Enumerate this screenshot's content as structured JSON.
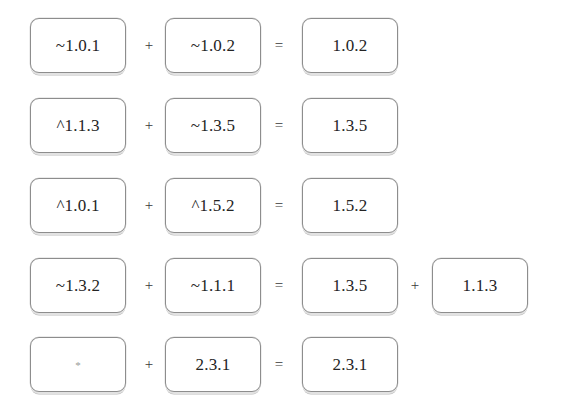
{
  "diagram": {
    "type": "semver-range-resolution",
    "title": "",
    "background_color": "#ffffff",
    "node_border_color": "#8d8d8d",
    "text_color": "#242424",
    "rows": [
      {
        "id": "row-1",
        "terms": [
          {
            "label": "~1.0.1",
            "kind": "range"
          },
          {
            "op": "+"
          },
          {
            "label": "~1.0.2",
            "kind": "range"
          },
          {
            "op": "="
          },
          {
            "label": "1.0.2",
            "kind": "resolved"
          }
        ]
      },
      {
        "id": "row-2",
        "terms": [
          {
            "label": "^1.1.3",
            "kind": "range"
          },
          {
            "op": "+"
          },
          {
            "label": "~1.3.5",
            "kind": "range"
          },
          {
            "op": "="
          },
          {
            "label": "1.3.5",
            "kind": "resolved"
          }
        ]
      },
      {
        "id": "row-3",
        "terms": [
          {
            "label": "^1.0.1",
            "kind": "range"
          },
          {
            "op": "+"
          },
          {
            "label": "^1.5.2",
            "kind": "range"
          },
          {
            "op": "="
          },
          {
            "label": "1.5.2",
            "kind": "resolved"
          }
        ]
      },
      {
        "id": "row-4",
        "terms": [
          {
            "label": "~1.3.2",
            "kind": "range"
          },
          {
            "op": "+"
          },
          {
            "label": "~1.1.1",
            "kind": "range"
          },
          {
            "op": "="
          },
          {
            "label": "1.3.5",
            "kind": "resolved"
          },
          {
            "op": "+"
          },
          {
            "label": "1.1.3",
            "kind": "resolved"
          }
        ]
      },
      {
        "id": "row-5",
        "terms": [
          {
            "label": "*",
            "kind": "wildcard"
          },
          {
            "op": "+"
          },
          {
            "label": "2.3.1",
            "kind": "range"
          },
          {
            "op": "="
          },
          {
            "label": "2.3.1",
            "kind": "resolved"
          }
        ]
      }
    ]
  }
}
